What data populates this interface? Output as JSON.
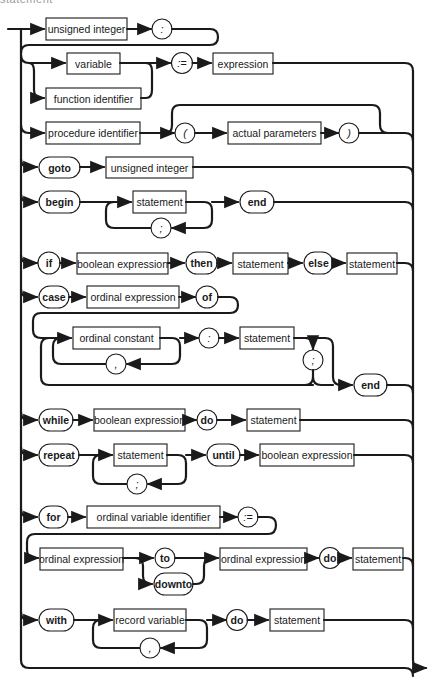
{
  "heading": {
    "text": "statement",
    "note": "cropped at top edge"
  },
  "diagram": {
    "title": "statement",
    "rows": {
      "labelled": {
        "label_node": "unsigned integer",
        "colon": ":"
      },
      "assignment": {
        "variable": "variable",
        "function_identifier": "function identifier",
        "assign": ":=",
        "expression": "expression"
      },
      "procedure_call": {
        "procedure_identifier": "procedure identifier",
        "lparen": "(",
        "actual_parameters": "actual parameters",
        "rparen": ")"
      },
      "goto": {
        "keyword": "goto",
        "target": "unsigned integer"
      },
      "compound": {
        "begin": "begin",
        "statement": "statement",
        "separator": ";",
        "end": "end"
      },
      "if": {
        "if": "if",
        "condition": "boolean expression",
        "then": "then",
        "then_statement": "statement",
        "else": "else",
        "else_statement": "statement"
      },
      "case": {
        "case": "case",
        "selector": "ordinal expression",
        "of": "of",
        "constant": "ordinal constant",
        "comma": ",",
        "colon": ":",
        "statement": "statement",
        "separator": ";",
        "end": "end"
      },
      "while": {
        "while": "while",
        "condition": "boolean expression",
        "do": "do",
        "statement": "statement"
      },
      "repeat": {
        "repeat": "repeat",
        "statement": "statement",
        "separator": ";",
        "until": "until",
        "condition": "boolean expression"
      },
      "for": {
        "for": "for",
        "control_variable": "ordinal variable identifier",
        "assign": ":=",
        "initial": "ordinal expression",
        "to": "to",
        "downto": "downto",
        "final": "ordinal expression",
        "do": "do",
        "statement": "statement"
      },
      "with": {
        "with": "with",
        "record_variable": "record variable",
        "comma": ",",
        "do": "do",
        "statement": "statement"
      }
    }
  }
}
